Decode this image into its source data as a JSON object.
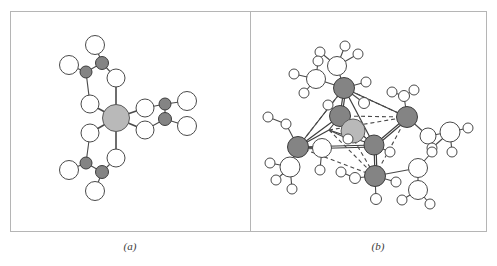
{
  "figure": {
    "type": "ball-and-stick molecular structure diagram",
    "background_color": "#ffffff",
    "frame_color": "#b5b5b5",
    "panels": [
      {
        "id": "a",
        "caption": "(a)",
        "description": "Mononuclear complex: one large light-grey central metal atom bonded to surrounding ligand groups",
        "atom_types": [
          {
            "name": "central-metal-atom",
            "color": "#b9b9b9",
            "radius": 13,
            "count": 1
          },
          {
            "name": "dark-atom",
            "color": "#848484",
            "radius": 6,
            "count": 6
          },
          {
            "name": "white-atom",
            "color": "#ffffff",
            "radius": 9,
            "count": 14
          }
        ]
      },
      {
        "id": "b",
        "caption": "(b)",
        "description": "Polynuclear cluster: one light-grey atom plus five dark metal atoms joined by solid and dashed metal-metal contacts, each capped with ligand groups",
        "atom_types": [
          {
            "name": "central-light-atom",
            "color": "#b9b9b9",
            "radius": 12,
            "count": 1
          },
          {
            "name": "dark-atom",
            "color": "#848484",
            "radius": 10,
            "count": 5
          },
          {
            "name": "white-atom",
            "color": "#ffffff",
            "radius": 9,
            "count": 12
          },
          {
            "name": "small-white-atom",
            "color": "#ffffff",
            "radius": 5,
            "count": 24
          }
        ],
        "bond_styles": [
          "solid",
          "dashed"
        ]
      }
    ]
  },
  "colors": {
    "atom_white_fill": "#ffffff",
    "atom_dark_fill": "#848484",
    "atom_center_fill": "#b9b9b9",
    "outline": "#4a4a4a",
    "frame": "#b5b5b5",
    "caption_text": "#3a3a3a"
  }
}
